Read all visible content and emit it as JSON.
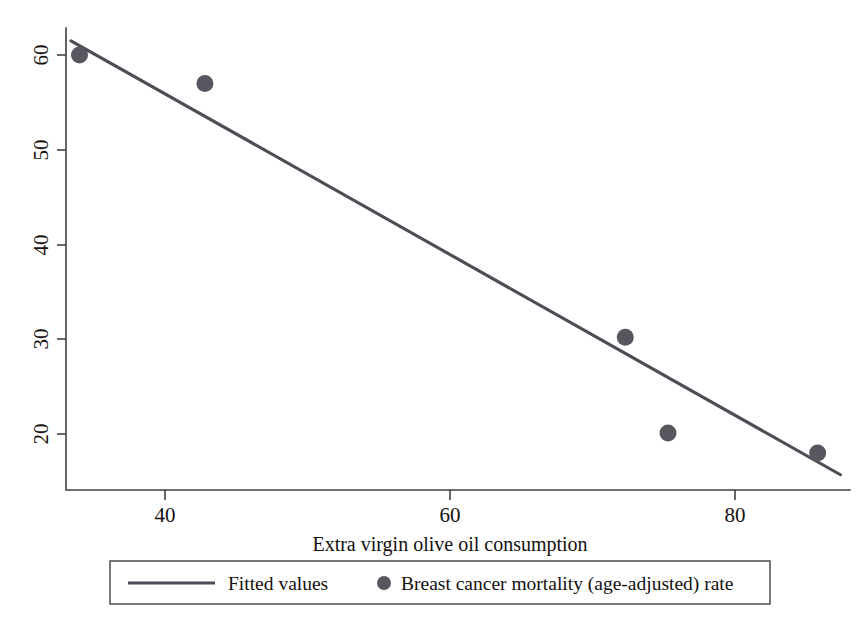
{
  "chart_data": {
    "type": "scatter",
    "title": "",
    "xlabel": "Extra virgin olive oil consumption",
    "ylabel": "",
    "xlim": [
      32.0,
      89.0
    ],
    "ylim": [
      14.5,
      62.5
    ],
    "xticks": [
      40,
      60,
      80
    ],
    "xtick_labels": [
      "40",
      "60",
      "80"
    ],
    "yticks": [
      20,
      30,
      40,
      50,
      60
    ],
    "ytick_labels": [
      "20",
      "30",
      "40",
      "50",
      "60"
    ],
    "grid": false,
    "legend_position": "bottom",
    "series": [
      {
        "name": "Fitted values",
        "type": "line",
        "color": "#4d4d55",
        "x": [
          33.4,
          87.4
        ],
        "y": [
          61.5,
          15.7
        ],
        "slope": -0.848,
        "intercept": 89.83
      },
      {
        "name": "Breast cancer mortality (age-adjusted) rate",
        "type": "scatter",
        "color": "#57575f",
        "x": [
          34.0,
          42.8,
          72.3,
          75.3,
          85.8
        ],
        "y": [
          60.0,
          57.0,
          30.2,
          20.1,
          18.0
        ],
        "points": [
          {
            "x": 34.0,
            "y": 60.0
          },
          {
            "x": 42.8,
            "y": 57.0
          },
          {
            "x": 72.3,
            "y": 30.2
          },
          {
            "x": 75.3,
            "y": 20.1
          },
          {
            "x": 85.8,
            "y": 18.0
          }
        ]
      }
    ]
  },
  "axes": {
    "x_title": "Extra virgin olive oil consumption",
    "x_tick_1": "40",
    "x_tick_2": "60",
    "x_tick_3": "80",
    "y_tick_1": "20",
    "y_tick_2": "30",
    "y_tick_3": "40",
    "y_tick_4": "50",
    "y_tick_5": "60"
  },
  "legend": {
    "entry_1_label": "Fitted values",
    "entry_1_marker": "line-swatch",
    "entry_2_label": "Breast cancer mortality (age-adjusted) rate",
    "entry_2_marker": "circle-dot"
  },
  "colors": {
    "line": "#4d4d55",
    "marker": "#57575f",
    "axis": "#3f3f46",
    "text": "#14100f",
    "background": "#ffffff"
  }
}
